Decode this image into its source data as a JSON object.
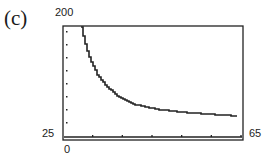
{
  "figure": {
    "panel_label": "(c)",
    "ymax_label": "200",
    "ymin_label": "25",
    "xmin_label": "0",
    "xmax_label": "65"
  },
  "chart_data": {
    "type": "line",
    "title": "",
    "panel_label": "(c)",
    "xlabel": "",
    "ylabel": "",
    "xlim": [
      0,
      65
    ],
    "ylim": [
      25,
      200
    ],
    "grid": false,
    "legend": null,
    "x_tick_count": 6,
    "y_tick_count": 8,
    "series": [
      {
        "name": "curve",
        "x": [
          6.5,
          8,
          9.7,
          12.3,
          15.2,
          19.9,
          26,
          35,
          45.9,
          63.2
        ],
        "values": [
          198,
          170,
          147,
          123,
          107,
          88,
          76,
          68,
          63,
          58
        ]
      }
    ]
  }
}
